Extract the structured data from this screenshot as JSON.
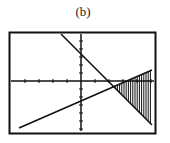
{
  "figure": {
    "label": "(b)"
  },
  "chart_data": {
    "type": "line",
    "title": "(b)",
    "xlabel": "",
    "ylabel": "",
    "grid": false,
    "legend": null,
    "axes": {
      "x_ticks_px": [
        25,
        39,
        53,
        67,
        95,
        109,
        123,
        137,
        151
      ],
      "y_ticks_px": [
        41,
        49,
        57,
        65,
        73,
        89,
        97,
        105,
        113,
        121,
        129
      ]
    },
    "series": [
      {
        "name": "decreasing-line",
        "points_px": [
          [
            61,
            34
          ],
          [
            152,
            125
          ]
        ]
      },
      {
        "name": "increasing-line",
        "points_px": [
          [
            19,
            128
          ],
          [
            152,
            70
          ]
        ]
      }
    ],
    "shaded_region": {
      "description": "region between the two lines to the right of their intersection",
      "x_from_px": 113,
      "x_to_px": 152,
      "style": "vertical-hatch"
    },
    "frame_px": {
      "left": 9,
      "top": 32,
      "right": 156,
      "bottom": 134
    },
    "origin_px": [
      81,
      81
    ]
  }
}
